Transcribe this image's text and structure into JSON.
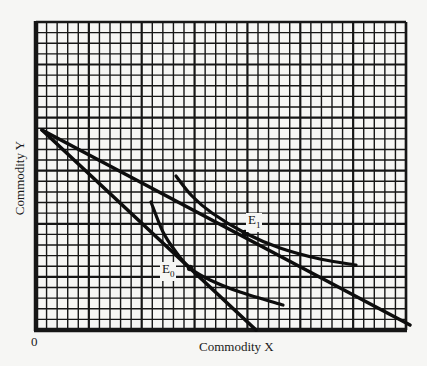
{
  "chart_data": {
    "type": "line",
    "title": "",
    "xlabel": "Commodity X",
    "ylabel": "Commodity Y",
    "origin_label": "0",
    "grid": true,
    "grid_cells": {
      "columns": 35,
      "rows": 29,
      "major_every": 5
    },
    "series": [
      {
        "name": "Budget line (initial, steep)",
        "kind": "budget",
        "points": [
          [
            42,
            130
          ],
          [
            256,
            330
          ]
        ]
      },
      {
        "name": "Budget line (new, flatter)",
        "kind": "budget",
        "points": [
          [
            42,
            130
          ],
          [
            410,
            325
          ]
        ]
      },
      {
        "name": "Indifference curve I0",
        "kind": "indifference",
        "points": [
          [
            151,
            202
          ],
          [
            163,
            232
          ],
          [
            176,
            252
          ],
          [
            190,
            268
          ],
          [
            210,
            280
          ],
          [
            240,
            292
          ],
          [
            283,
            305
          ]
        ]
      },
      {
        "name": "Indifference curve I1",
        "kind": "indifference",
        "points": [
          [
            176,
            176
          ],
          [
            192,
            196
          ],
          [
            212,
            213
          ],
          [
            245,
            233
          ],
          [
            280,
            248
          ],
          [
            320,
            259
          ],
          [
            356,
            265
          ]
        ]
      }
    ],
    "annotations": [
      {
        "label": "E",
        "sub": "0",
        "x": 190,
        "y": 268
      },
      {
        "label": "E",
        "sub": "1",
        "x": 245,
        "y": 233
      }
    ]
  },
  "labels": {
    "x_axis": "Commodity X",
    "y_axis": "Commodity Y",
    "origin": "0",
    "e0_main": "E",
    "e0_sub": "0",
    "e1_main": "E",
    "e1_sub": "1"
  }
}
